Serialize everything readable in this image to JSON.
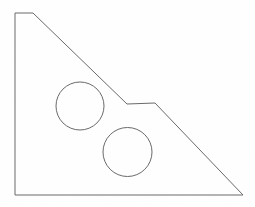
{
  "figure": {
    "background_color": "#fefefe",
    "stroke_color": "#6a6a6a",
    "stroke_width": 1,
    "fill_color": "none",
    "canvas": {
      "width": 255,
      "height": 207
    }
  },
  "chart_data": {
    "type": "line",
    "xlabel": "",
    "ylabel": "",
    "xlim": [
      0,
      255
    ],
    "ylim": [
      0,
      207
    ],
    "grid": false,
    "legend": "none",
    "shapes": [
      {
        "name": "plate-outline",
        "kind": "polygon",
        "closed": true,
        "stroke": "#6a6a6a",
        "fill": "none",
        "points": [
          [
            15,
            13
          ],
          [
            33,
            13
          ],
          [
            127,
            104
          ],
          [
            155,
            103
          ],
          [
            243,
            195
          ],
          [
            15,
            195
          ]
        ],
        "path": "M 15 13 L 33 13 L 127 104 L 155 103 L 243 195 L 15 195 Z"
      },
      {
        "name": "upper-hole",
        "kind": "circle",
        "stroke": "#6a6a6a",
        "fill": "none",
        "cx": 80,
        "cy": 106,
        "r": 24
      },
      {
        "name": "lower-hole",
        "kind": "circle",
        "stroke": "#6a6a6a",
        "fill": "none",
        "cx": 127.5,
        "cy": 152,
        "r": 24.5
      }
    ],
    "annotations": [],
    "tick_labels": {
      "x": [],
      "y": []
    }
  }
}
